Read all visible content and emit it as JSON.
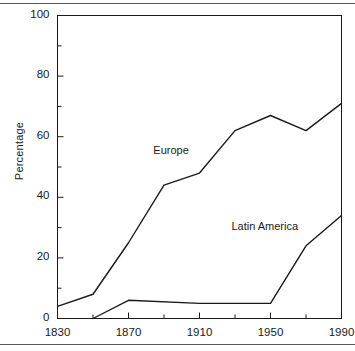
{
  "chart_data": {
    "type": "line",
    "title": "",
    "subtitle": "",
    "xlabel": "",
    "ylabel": "Percentage",
    "xlim": [
      1830,
      1990
    ],
    "ylim": [
      0,
      100
    ],
    "grid": false,
    "legend_position": "inline-annotations",
    "x_ticks": [
      1830,
      1870,
      1910,
      1950,
      1990
    ],
    "x_tick_labels": [
      "1830",
      "1870",
      "1910",
      "1950",
      "1990"
    ],
    "x_minor_ticks": [
      1850,
      1890,
      1930,
      1970
    ],
    "y_ticks": [
      0,
      20,
      40,
      60,
      80,
      100
    ],
    "y_tick_labels": [
      "0",
      "20",
      "40",
      "60",
      "80",
      "100"
    ],
    "y_minor_ticks": [
      10,
      30,
      50,
      70,
      90
    ],
    "series": [
      {
        "name": "Europe",
        "color": "#1a1a1a",
        "x": [
          1830,
          1850,
          1870,
          1890,
          1910,
          1930,
          1950,
          1970,
          1990
        ],
        "values": [
          4,
          8,
          25,
          44,
          48,
          62,
          67,
          62,
          71
        ],
        "label_x": 1884,
        "label_y": 55
      },
      {
        "name": "Latin America",
        "color": "#1a1a1a",
        "x": [
          1850,
          1870,
          1910,
          1950,
          1970,
          1990
        ],
        "values": [
          0,
          6,
          5,
          5,
          24,
          34
        ],
        "label_x": 1928,
        "label_y": 30
      }
    ]
  },
  "axis": {
    "y_title": "Percentage"
  },
  "colors": {
    "line": "#1a1a1a",
    "frame": "#1a1a1a",
    "rule": "#5a5a5a",
    "background": "#ffffff"
  }
}
